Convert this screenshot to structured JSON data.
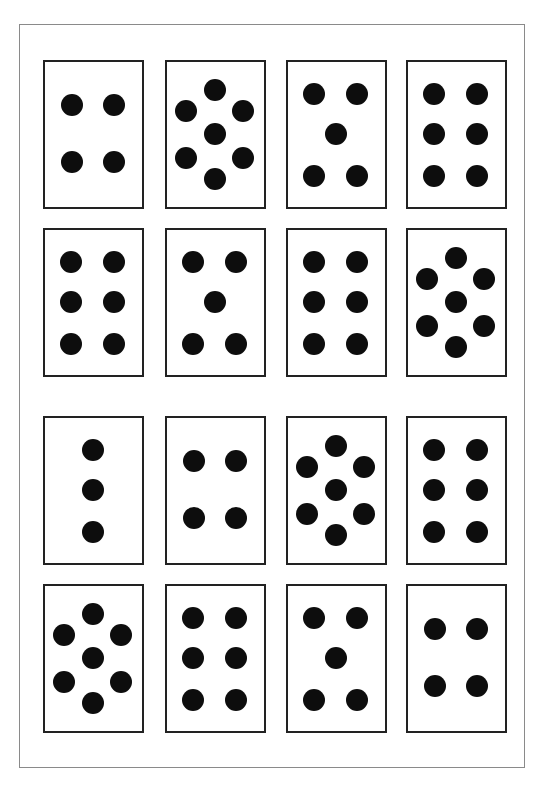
{
  "puzzle": {
    "rows": 4,
    "columns": 4,
    "cards": [
      {
        "row": 0,
        "col": 0,
        "count": 4,
        "pattern": "square-4"
      },
      {
        "row": 0,
        "col": 1,
        "count": 7,
        "pattern": "hexagon-7"
      },
      {
        "row": 0,
        "col": 2,
        "count": 5,
        "pattern": "quincunx-5"
      },
      {
        "row": 0,
        "col": 3,
        "count": 6,
        "pattern": "grid-6"
      },
      {
        "row": 1,
        "col": 0,
        "count": 6,
        "pattern": "grid-6"
      },
      {
        "row": 1,
        "col": 1,
        "count": 5,
        "pattern": "quincunx-5"
      },
      {
        "row": 1,
        "col": 2,
        "count": 6,
        "pattern": "grid-6"
      },
      {
        "row": 1,
        "col": 3,
        "count": 7,
        "pattern": "hexagon-7"
      },
      {
        "row": 2,
        "col": 0,
        "count": 3,
        "pattern": "column-3"
      },
      {
        "row": 2,
        "col": 1,
        "count": 4,
        "pattern": "square-4"
      },
      {
        "row": 2,
        "col": 2,
        "count": 7,
        "pattern": "hexagon-7"
      },
      {
        "row": 2,
        "col": 3,
        "count": 6,
        "pattern": "grid-6"
      },
      {
        "row": 3,
        "col": 0,
        "count": 7,
        "pattern": "hexagon-7"
      },
      {
        "row": 3,
        "col": 1,
        "count": 6,
        "pattern": "grid-6"
      },
      {
        "row": 3,
        "col": 2,
        "count": 5,
        "pattern": "quincunx-5"
      },
      {
        "row": 3,
        "col": 3,
        "count": 4,
        "pattern": "square-4"
      }
    ]
  },
  "colors": {
    "dot": "#0d0d0d",
    "card_border": "#222222",
    "frame_border": "#8a8a8a",
    "background": "#ffffff"
  }
}
